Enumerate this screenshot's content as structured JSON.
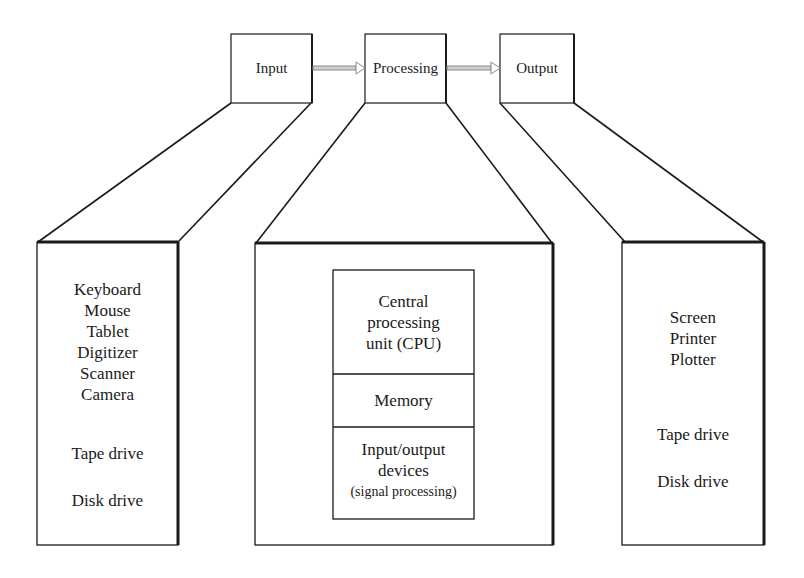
{
  "top_row": {
    "input": "Input",
    "processing": "Processing",
    "output": "Output"
  },
  "input_devices": {
    "group1": [
      "Keyboard",
      "Mouse",
      "Tablet",
      "Digitizer",
      "Scanner",
      "Camera"
    ],
    "group2": [
      "Tape drive",
      "Disk drive"
    ]
  },
  "processing_units": {
    "cpu": [
      "Central",
      "processing",
      "unit (CPU)"
    ],
    "memory": "Memory",
    "io": [
      "Input/output",
      "devices"
    ],
    "io_note": "(signal processing)"
  },
  "output_devices": {
    "group1": [
      "Screen",
      "Printer",
      "Plotter"
    ],
    "group2": [
      "Tape drive",
      "Disk drive"
    ]
  },
  "colors": {
    "line": "#1a1a1a",
    "arrow": "#9a9a9a"
  }
}
